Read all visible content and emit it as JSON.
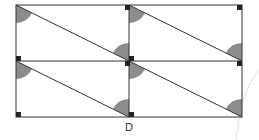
{
  "diagram": {
    "labels": [
      {
        "id": "D",
        "text": "D"
      }
    ],
    "colors": {
      "line": "#333333",
      "shade": "#8c8c8c",
      "marker": "#222222",
      "faint_arc": "#dddddd"
    }
  }
}
